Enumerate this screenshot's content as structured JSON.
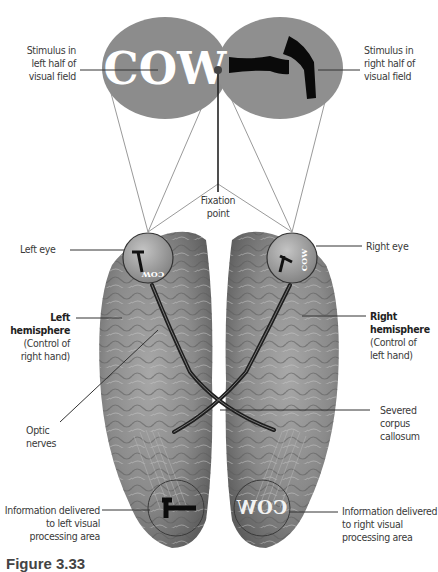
{
  "figure": {
    "caption": "Figure 3.33",
    "stimulus_left": {
      "word": "COW",
      "label_lines": [
        "Stimulus in",
        "left half of",
        "visual field"
      ]
    },
    "stimulus_right": {
      "object": "hammer-icon",
      "label_lines": [
        "Stimulus in",
        "right half of",
        "visual field"
      ]
    },
    "fixation_point": {
      "label_lines": [
        "Fixation",
        "point"
      ]
    },
    "left_eye": {
      "label": "Left eye"
    },
    "right_eye": {
      "label": "Right eye"
    },
    "left_hemisphere": {
      "title_lines": [
        "Left",
        "hemisphere"
      ],
      "detail_lines": [
        "(Control of",
        "right hand)"
      ]
    },
    "right_hemisphere": {
      "title_lines": [
        "Right",
        "hemisphere"
      ],
      "detail_lines": [
        "(Control of",
        "left hand)"
      ]
    },
    "optic_nerves": {
      "label_lines": [
        "Optic",
        "nerves"
      ]
    },
    "corpus_callosum": {
      "label_lines": [
        "Severed",
        "corpus",
        "callosum"
      ]
    },
    "left_processing": {
      "label_lines": [
        "Information delivered",
        "to left visual",
        "processing area"
      ]
    },
    "right_processing": {
      "label_lines": [
        "Information delivered",
        "to right visual",
        "processing area"
      ],
      "mirrored_word": "COW"
    },
    "colors": {
      "stimulus_fill": "#8c8c8c",
      "brain_fill": "#7d7d7d",
      "leader_line": "#333333",
      "ray_line": "#9a9a9a",
      "nerve": "#1e1e1e"
    }
  }
}
